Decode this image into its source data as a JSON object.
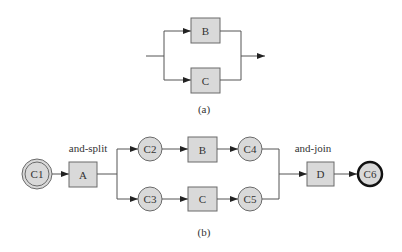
{
  "diagram_a": {
    "caption": "(a)",
    "tasks": [
      {
        "id": "B",
        "label": "B"
      },
      {
        "id": "C",
        "label": "C"
      }
    ]
  },
  "diagram_b": {
    "caption": "(b)",
    "split_label": "and-split",
    "join_label": "and-join",
    "places": [
      {
        "id": "C1",
        "label": "C1",
        "type": "start"
      },
      {
        "id": "C2",
        "label": "C2"
      },
      {
        "id": "C3",
        "label": "C3"
      },
      {
        "id": "C4",
        "label": "C4"
      },
      {
        "id": "C5",
        "label": "C5"
      },
      {
        "id": "C6",
        "label": "C6",
        "type": "end"
      }
    ],
    "transitions": [
      {
        "id": "A",
        "label": "A"
      },
      {
        "id": "B",
        "label": "B"
      },
      {
        "id": "C",
        "label": "C"
      },
      {
        "id": "D",
        "label": "D"
      }
    ]
  },
  "colors": {
    "node_fill": "#d9d9d9",
    "stroke": "#6a6a6a",
    "edge": "#555555"
  }
}
